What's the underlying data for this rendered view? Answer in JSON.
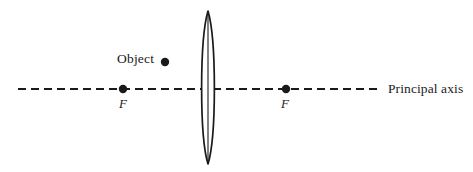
{
  "diagram": {
    "background_color": "#ffffff",
    "stroke_color": "#1a1a1a",
    "labels": {
      "object": "Object",
      "principal_axis": "Principal axis",
      "focal_left": "F",
      "focal_right": "F"
    },
    "elements": {
      "principal_axis": {
        "name": "principal-axis",
        "style": "dashed",
        "x_start": 18,
        "x_end": 381,
        "y": 89,
        "dash_length": 8,
        "gap_length": 5,
        "stroke_width": 2.1
      },
      "lens": {
        "name": "converging-lens",
        "type": "biconvex",
        "center_x": 208,
        "center_y": 88,
        "top_y": 11,
        "bottom_y": 164,
        "half_width": 6.5,
        "stroke_width": 1.7,
        "has_center_line": true
      },
      "object_point": {
        "name": "object-point",
        "x": 165,
        "y": 62,
        "radius": 4.2
      },
      "focal_point_left": {
        "name": "focal-point-left",
        "x": 123,
        "y": 89,
        "radius": 4.2
      },
      "focal_point_right": {
        "name": "focal-point-right",
        "x": 286,
        "y": 89,
        "radius": 4.2
      }
    }
  }
}
